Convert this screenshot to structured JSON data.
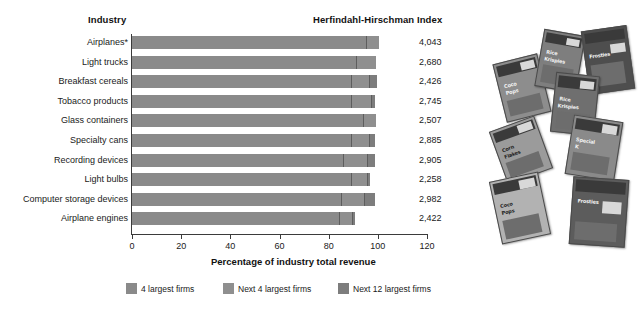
{
  "headers": {
    "industry": "Industry",
    "hhi": "Herfindahl-Hirschman Index"
  },
  "axis": {
    "x_title": "Percentage of industry total revenue",
    "x_ticks": [
      "0",
      "20",
      "40",
      "60",
      "80",
      "100",
      "120"
    ],
    "x_min": 0,
    "x_max": 120
  },
  "legend": [
    {
      "label": "4 largest firms",
      "color": "#8a8a8a",
      "icon": "legend-swatch"
    },
    {
      "label": "Next 4 largest firms",
      "color": "#8f8f8f",
      "icon": "legend-swatch"
    },
    {
      "label": "Next 12 largest firms",
      "color": "#7d7d7d",
      "icon": "legend-swatch"
    }
  ],
  "photo": {
    "caption_alt": "cereal-boxes-photo",
    "brands": [
      "Rice Krispies",
      "Frosties",
      "Coco Pops",
      "Corn Flakes",
      "Special K"
    ]
  },
  "chart_data": {
    "type": "bar",
    "orientation": "horizontal",
    "stacked": true,
    "title": "",
    "xlabel": "Percentage of industry total revenue",
    "ylabel": "Industry",
    "xlim": [
      0,
      120
    ],
    "xticks": [
      0,
      20,
      40,
      60,
      80,
      100,
      120
    ],
    "grid": false,
    "legend_position": "bottom",
    "categories": [
      "Airplanes*",
      "Light trucks",
      "Breakfast cereals",
      "Tobacco products",
      "Glass containers",
      "Specialty cans",
      "Recording devices",
      "Light bulbs",
      "Computer storage devices",
      "Airplane engines"
    ],
    "series": [
      {
        "name": "4 largest firms",
        "values": [
          95,
          91,
          89,
          89,
          94,
          89,
          86,
          89,
          85,
          84
        ]
      },
      {
        "name": "Next 4 largest firms",
        "values": [
          5,
          8,
          7,
          8,
          5,
          7,
          9,
          6,
          9,
          5
        ]
      },
      {
        "name": "Next 12 largest firms",
        "values": [
          0,
          0,
          3,
          1,
          0,
          2,
          3,
          1,
          4,
          1
        ]
      }
    ],
    "totals": [
      100,
      99,
      99,
      98,
      99,
      98,
      98,
      96,
      98,
      90
    ],
    "hhi_values": [
      "4,043",
      "2,680",
      "2,426",
      "2,745",
      "2,507",
      "2,885",
      "2,905",
      "2,258",
      "2,982",
      "2,422"
    ],
    "footnote_marker": "*"
  }
}
